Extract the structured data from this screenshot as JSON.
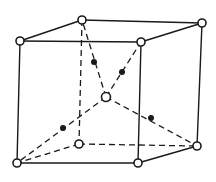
{
  "diagram": {
    "type": "crystal-unit-cell",
    "colors": {
      "line": "#1a1a1a",
      "background": "#ffffff",
      "open_atom_fill": "#ffffff",
      "filled_atom": "#1a1a1a"
    },
    "vertices": {
      "top_back_left": [
        82,
        20
      ],
      "top_back_right": [
        202,
        23
      ],
      "top_front_left": [
        20,
        41
      ],
      "top_front_right": [
        141,
        42
      ],
      "bottom_back_left": [
        79,
        144
      ],
      "bottom_back_right": [
        197,
        146
      ],
      "bottom_front_left": [
        17,
        163
      ],
      "bottom_front_right": [
        138,
        163
      ],
      "center": [
        106,
        97
      ]
    },
    "solid_edges": [
      [
        "top_front_left",
        "top_back_left"
      ],
      [
        "top_back_left",
        "top_back_right"
      ],
      [
        "top_front_left",
        "top_front_right"
      ],
      [
        "top_front_right",
        "top_back_right"
      ],
      [
        "top_front_left",
        "bottom_front_left"
      ],
      [
        "top_front_right",
        "bottom_front_right"
      ],
      [
        "top_back_right",
        "bottom_back_right"
      ],
      [
        "bottom_front_left",
        "bottom_front_right"
      ],
      [
        "bottom_front_right",
        "bottom_back_right"
      ]
    ],
    "dashed_edges": [
      [
        "top_back_left",
        "bottom_back_left"
      ],
      [
        "bottom_back_left",
        "bottom_back_right"
      ],
      [
        "bottom_back_left",
        "bottom_front_left"
      ],
      [
        "center",
        "top_back_left"
      ],
      [
        "center",
        "top_front_right"
      ],
      [
        "center",
        "bottom_front_left"
      ],
      [
        "center",
        "bottom_back_right"
      ]
    ],
    "open_atoms": [
      "top_back_left",
      "top_back_right",
      "top_front_left",
      "top_front_right",
      "bottom_back_left",
      "bottom_back_right",
      "bottom_front_left",
      "bottom_front_right",
      "center"
    ],
    "filled_atoms": [
      [
        94,
        62
      ],
      [
        122,
        72
      ],
      [
        63,
        128
      ],
      [
        151,
        118
      ]
    ]
  }
}
